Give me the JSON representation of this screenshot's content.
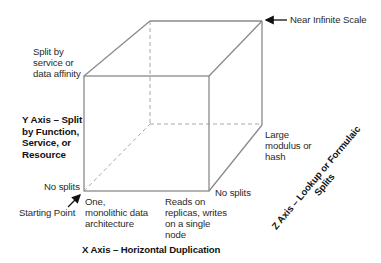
{
  "diagram": {
    "colors": {
      "edge": "#8a8a8a",
      "dashed_edge": "#a0a0a0",
      "text": "#2a2a2a",
      "axis_text": "#111111",
      "arrow": "#111111"
    },
    "top_right_label": "Near Infinite Scale",
    "y_axis": {
      "title": "Y Axis – Split\nby Function,\nService, or\nResource",
      "top_label": "Split by\nservice or\ndata affinity",
      "bottom_label": "No splits"
    },
    "x_axis": {
      "title": "X Axis – Horizontal Duplication",
      "left_label": "One,\nmonolithic data\narchitecture",
      "right_label": "Reads on\nreplicas, writes\non a single\nnode"
    },
    "z_axis": {
      "title": "Z Axis – Lookup or Formulaic\nSplits",
      "top_label": "Large\nmodulus or\nhash",
      "bottom_label": "No splits"
    },
    "origin_label": "Starting Point"
  }
}
